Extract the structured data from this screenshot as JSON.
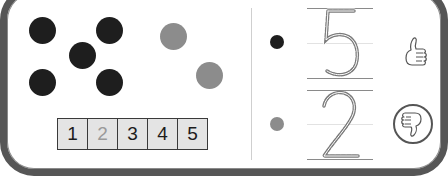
{
  "colors": {
    "frame": "#565656",
    "dot_dark": "#1e1e1e",
    "dot_grey": "#8c8c8c",
    "cell_bg": "#e4e4e4",
    "digit_stroke": "#7a7a7a"
  },
  "counting_area": {
    "dark_dots": 5,
    "grey_dots": 2,
    "number_strip": [
      {
        "label": "1",
        "dimmed": false
      },
      {
        "label": "2",
        "dimmed": true
      },
      {
        "label": "3",
        "dimmed": false
      },
      {
        "label": "4",
        "dimmed": false
      },
      {
        "label": "5",
        "dimmed": false
      }
    ]
  },
  "answer_rows": [
    {
      "dot_color": "dark",
      "digit": "5",
      "feedback": "thumbs-up"
    },
    {
      "dot_color": "grey",
      "digit": "2",
      "feedback": "thumbs-down-selected"
    }
  ]
}
